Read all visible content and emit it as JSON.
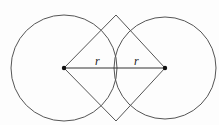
{
  "diagram": {
    "left_circle": {
      "cx": 64,
      "cy": 68,
      "r": 53
    },
    "right_circle": {
      "cx": 165,
      "cy": 68,
      "r": 51
    },
    "rhombus": {
      "points": [
        [
          64,
          68
        ],
        [
          116,
          15
        ],
        [
          165,
          68
        ],
        [
          116,
          121
        ]
      ]
    },
    "labels": [
      {
        "text": "r",
        "x": 95,
        "y": 65
      },
      {
        "text": "r",
        "x": 134,
        "y": 65
      }
    ],
    "line_color": "#555555",
    "point_color": "#111111"
  }
}
